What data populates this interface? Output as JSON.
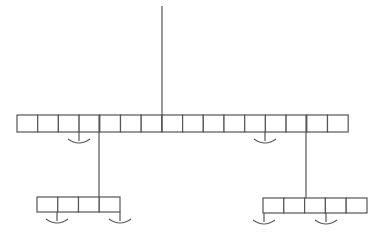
{
  "diagram": {
    "type": "hierarchical-array-tree",
    "colors": {
      "line": "#555555",
      "background": "#ffffff"
    },
    "root_stem": {
      "x": 162,
      "y1": 6,
      "y2": 115
    },
    "arrays": [
      {
        "id": "top-array",
        "x": 17,
        "y": 115,
        "cell_width": 20.7,
        "height": 17,
        "cells": 16,
        "hooks": [
          {
            "x": 79
          },
          {
            "x": 265
          }
        ]
      },
      {
        "id": "bottom-left-array",
        "x": 37,
        "y": 197,
        "cell_width": 20.75,
        "height": 15,
        "cells": 4,
        "hooks": [
          {
            "x": 57
          },
          {
            "x": 120
          }
        ]
      },
      {
        "id": "bottom-right-array",
        "x": 263,
        "y": 198,
        "cell_width": 20.8,
        "height": 15,
        "cells": 5,
        "hooks": [
          {
            "x": 264
          },
          {
            "x": 326
          }
        ]
      }
    ],
    "connectors": [
      {
        "id": "left-connector",
        "x": 99,
        "y1": 132,
        "y2": 197
      },
      {
        "id": "right-connector",
        "x": 306,
        "y1": 132,
        "y2": 198
      }
    ],
    "hook_style": {
      "stem_length": 9,
      "arc_half_width": 11,
      "arc_depth": 4
    }
  }
}
